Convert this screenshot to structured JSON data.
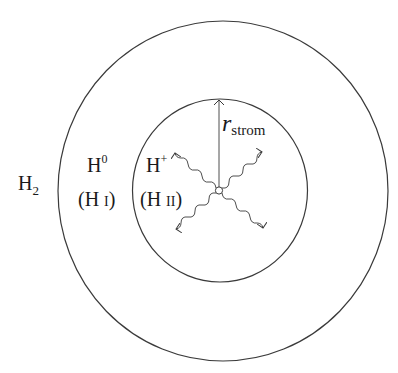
{
  "diagram": {
    "title": "",
    "regions": [
      {
        "id": "outer",
        "label": "H2",
        "label_main": "H",
        "label_sub": "2"
      },
      {
        "id": "neutral",
        "label_main": "H",
        "label_sup": "0",
        "label_alt": "(H I)",
        "alt_main": "(H ",
        "alt_roman": "I",
        "alt_close": ")"
      },
      {
        "id": "ionized",
        "label_main": "H",
        "label_sup": "+",
        "label_alt": "(H II)",
        "alt_main": "(H ",
        "alt_roman": "II",
        "alt_close": ")"
      }
    ],
    "radius_label": {
      "main": "r",
      "sub": "strom"
    },
    "colors": {
      "line": "#3a3a3a",
      "text": "#1a1a1a",
      "background": "#ffffff"
    }
  }
}
